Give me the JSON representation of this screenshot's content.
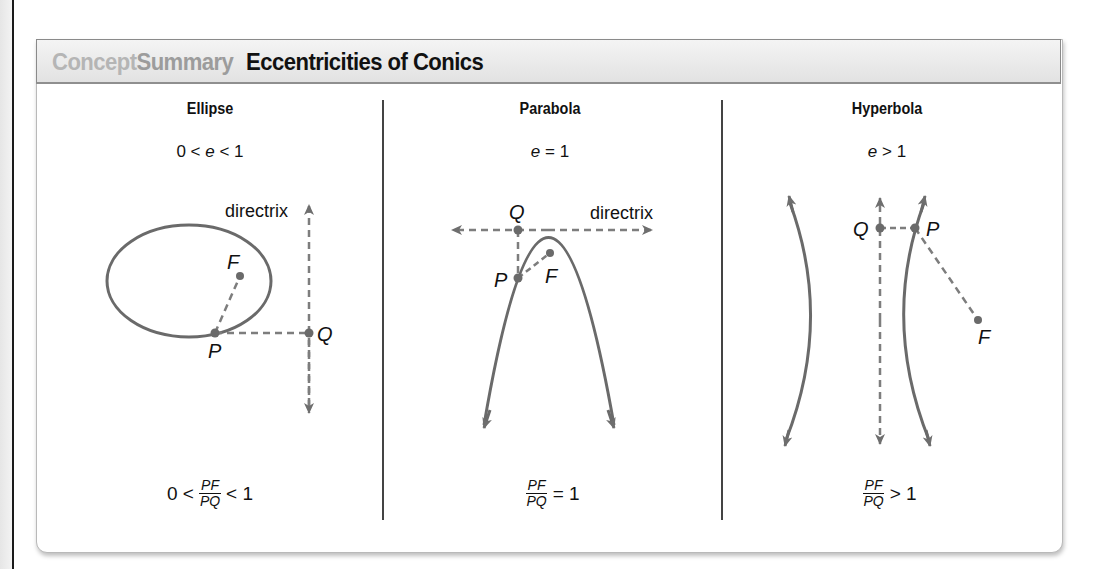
{
  "header": {
    "badge_part1": "Concept",
    "badge_part2": "Summary",
    "title": "Eccentricities of Conics"
  },
  "columns": [
    {
      "name": "Ellipse",
      "eccentricity": {
        "pre": "0 < ",
        "var": "e",
        "post": " < 1"
      },
      "formula": {
        "pre": "0 <",
        "num": "PF",
        "den": "PQ",
        "post": "< 1"
      },
      "labels": {
        "focus": "F",
        "point": "P",
        "directrix_point": "Q",
        "directrix": "directrix"
      }
    },
    {
      "name": "Parabola",
      "eccentricity": {
        "pre": "",
        "var": "e",
        "post": " = 1"
      },
      "formula": {
        "pre": "",
        "num": "PF",
        "den": "PQ",
        "post": "= 1"
      },
      "labels": {
        "focus": "F",
        "point": "P",
        "directrix_point": "Q",
        "directrix": "directrix"
      }
    },
    {
      "name": "Hyperbola",
      "eccentricity": {
        "pre": "",
        "var": "e",
        "post": " > 1"
      },
      "formula": {
        "pre": "",
        "num": "PF",
        "den": "PQ",
        "post": "> 1"
      },
      "labels": {
        "focus": "F",
        "point": "P",
        "directrix_point": "Q"
      }
    }
  ],
  "colors": {
    "curve": "#6a6a6a",
    "dashed": "#7d7d7d",
    "header_concept": "#b5b5b5",
    "header_summary": "#9c9c9c"
  }
}
